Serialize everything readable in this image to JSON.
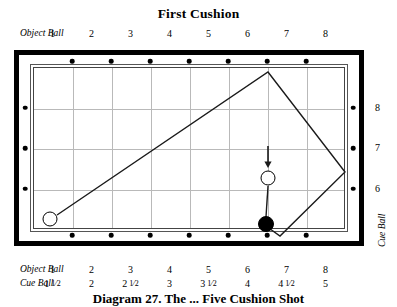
{
  "title": "First Cushion",
  "caption": "Diagram 27.  The ... Five Cushion Shot",
  "axes": {
    "top": {
      "name": "Object Ball",
      "ticks": [
        "1",
        "2",
        "3",
        "4",
        "5",
        "6",
        "7",
        "8"
      ]
    },
    "bottom_object": {
      "name": "Object Ball",
      "ticks": [
        "1",
        "2",
        "3",
        "4",
        "5",
        "6",
        "7",
        "8"
      ]
    },
    "bottom_cue": {
      "name": "Cue Ball",
      "ticks": [
        "1 1/2",
        "2",
        "2 1/2",
        "3",
        "3 1/2",
        "4",
        "4 1/2",
        "5"
      ],
      "ticks_whole": [
        "1",
        "2",
        "2",
        "3",
        "3",
        "4",
        "4",
        "5"
      ],
      "ticks_frac": [
        "1/2",
        "",
        "1/2",
        "",
        "1/2",
        "",
        "1/2",
        ""
      ]
    },
    "right": {
      "name": "Cue Ball",
      "ticks": [
        "8",
        "7",
        "6"
      ]
    }
  },
  "table": {
    "rails": {
      "top_diamonds": 7,
      "bottom_diamonds": 7,
      "left_diamonds": 3,
      "right_diamonds": 3
    },
    "grid": {
      "columns": 8,
      "rows": 4
    },
    "cloth_color": "#ffffff",
    "rail_color": "#000000",
    "grid_color": "#b9b9b9"
  },
  "shot": {
    "balls": [
      {
        "id": "cue-start",
        "type": "cue",
        "x": 50,
        "y": 219,
        "r": 7.5
      },
      {
        "id": "cue-target",
        "type": "cue",
        "x": 268,
        "y": 178,
        "r": 7.5
      },
      {
        "id": "object-ball",
        "type": "object",
        "x": 266,
        "y": 224,
        "r": 8.0
      }
    ],
    "path": [
      {
        "x": 57,
        "y": 215
      },
      {
        "x": 268,
        "y": 72
      },
      {
        "x": 345,
        "y": 172
      },
      {
        "x": 280,
        "y": 236
      },
      {
        "x": 266,
        "y": 226
      }
    ],
    "arrow": {
      "from_x": 268,
      "from_y": 146,
      "to_x": 268,
      "to_y": 168
    },
    "aim_line": {
      "from_x": 268,
      "from_y": 186,
      "to_x": 266,
      "to_y": 217
    },
    "line_color": "#1a1a1a"
  }
}
